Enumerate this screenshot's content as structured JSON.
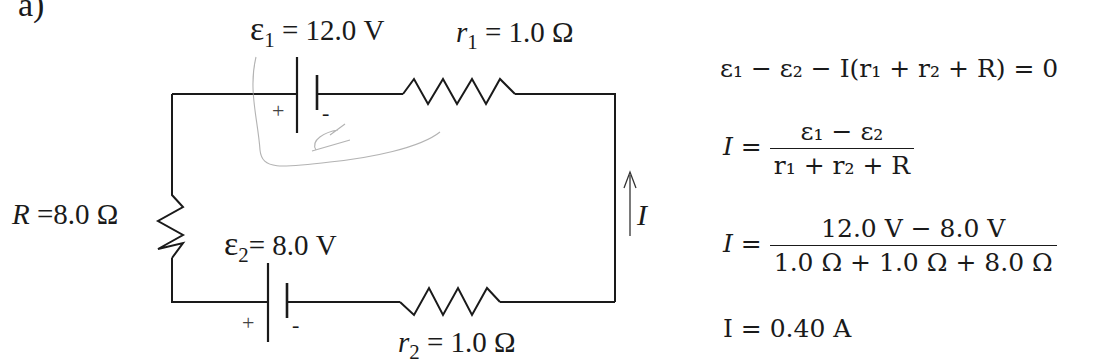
{
  "part_label": "a)",
  "circuit": {
    "emf1": {
      "symbol": "ε",
      "sub": "1",
      "value": "= 12.0 V"
    },
    "r1": {
      "symbol": "r",
      "sub": "1",
      "value": "= 1.0 Ω"
    },
    "R": {
      "symbol": "R",
      "value": " =8.0 Ω"
    },
    "emf2": {
      "symbol": "ε",
      "sub": "2",
      "value": "= 8.0 V"
    },
    "r2": {
      "symbol": "r",
      "sub": "2",
      "value": "= 1.0 Ω"
    },
    "current": {
      "symbol": "I"
    },
    "battery1_plus": "+",
    "battery1_minus": "-",
    "battery2_plus": "+",
    "battery2_minus": "-"
  },
  "equations": {
    "loop": "ε₁ − ε₂ − I(r₁ + r₂ + R) = 0",
    "solve_lhs": "I =",
    "solve_num": "ε₁ − ε₂",
    "solve_den": "r₁ + r₂ + R",
    "sub_lhs": "I =",
    "sub_num": "12.0 V − 8.0 V",
    "sub_den": "1.0 Ω + 1.0 Ω + 8.0 Ω",
    "result": "I = 0.40 A"
  },
  "colors": {
    "ink": "#1a1a1a",
    "annotation": "#9a9a9a"
  }
}
